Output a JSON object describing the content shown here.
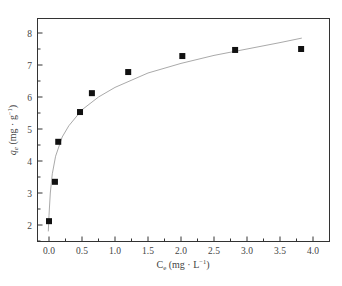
{
  "chart_data": {
    "type": "scatter",
    "title": "",
    "xlabel": "C_e (mg · L⁻¹)",
    "ylabel": "q_e (mg · g⁻¹)",
    "xlabel_parts": {
      "main": "C",
      "sub": "e",
      "unit": " (mg · L",
      "sup": "−1",
      "close": ")"
    },
    "ylabel_parts": {
      "main": "q",
      "sub": "e",
      "unit": " (mg · g",
      "sup": "−1",
      "close": ")"
    },
    "xlim": [
      -0.12,
      4.3
    ],
    "ylim": [
      1.5,
      8.5
    ],
    "x_ticks": [
      "0.0",
      "0.5",
      "1.0",
      "1.5",
      "2.0",
      "2.5",
      "3.0",
      "3.5",
      "4.0"
    ],
    "y_ticks": [
      "2",
      "3",
      "4",
      "5",
      "6",
      "7",
      "8"
    ],
    "grid": false,
    "legend": null,
    "series": [
      {
        "name": "Experimental data",
        "type": "scatter",
        "marker": "square",
        "color": "#111111",
        "x": [
          0.0,
          0.09,
          0.14,
          0.47,
          0.65,
          1.2,
          2.02,
          2.82,
          3.82
        ],
        "y": [
          2.12,
          3.35,
          4.6,
          5.53,
          6.12,
          6.78,
          7.28,
          7.47,
          7.5
        ]
      },
      {
        "name": "Fitted isotherm",
        "type": "line",
        "color": "#aaaaaa",
        "x": [
          -0.01,
          0.0,
          0.02,
          0.05,
          0.1,
          0.2,
          0.3,
          0.5,
          0.75,
          1.0,
          1.5,
          2.0,
          2.5,
          3.0,
          3.5,
          3.83
        ],
        "y": [
          1.8,
          2.3,
          3.0,
          3.6,
          4.15,
          4.75,
          5.1,
          5.6,
          6.0,
          6.3,
          6.75,
          7.05,
          7.3,
          7.5,
          7.7,
          7.84
        ]
      }
    ]
  }
}
